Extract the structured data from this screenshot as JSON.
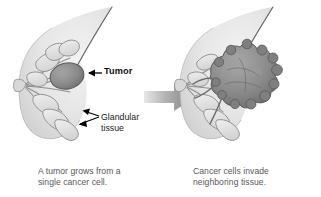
{
  "figure": {
    "background_color": "#ffffff",
    "width": 321,
    "height": 197
  },
  "colors": {
    "breast_fill": "#e2e2e2",
    "breast_fill_light": "#f0f0f0",
    "breast_outline": "#6b6b6b",
    "duct_stroke": "#8e8e8e",
    "lobule_fill": "#dcdcdc",
    "tumor_fill": "#8a8a8a",
    "tumor_outline": "#5d5d5d",
    "invasive_mass_fill": "#8f8f8f",
    "invasive_mass_outline": "#5a5a5a",
    "label_text": "#111111",
    "caption_text": "#58585a",
    "arrow_dark": "#000000",
    "arrow_gray": "#9a9a9a"
  },
  "panels": [
    {
      "id": "left",
      "art_name": "breast-cross-section-with-tumor",
      "labels": [
        {
          "name": "tumor",
          "text": "Tumor",
          "bold": true
        },
        {
          "name": "glandular-tissue",
          "line1": "Glandular",
          "line2": "tissue",
          "bold": false
        }
      ],
      "caption": {
        "line1": "A tumor grows from a",
        "line2": "single cancer cell."
      }
    },
    {
      "id": "right",
      "art_name": "breast-cross-section-with-invasive-cancer",
      "labels": [],
      "caption": {
        "line1": "Cancer cells invade",
        "line2": "neighboring tissue."
      }
    }
  ],
  "connector": {
    "name": "progression-arrow",
    "direction": "right",
    "style": "gray-gradient-block-arrow"
  }
}
